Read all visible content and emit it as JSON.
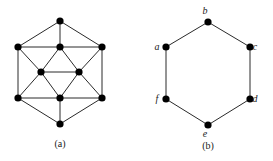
{
  "figures": [
    {
      "id": "a",
      "caption": "(a)",
      "caption_pos": [
        60,
        147
      ],
      "nodes": [
        {
          "x": 60,
          "y": 21
        },
        {
          "x": 18,
          "y": 47
        },
        {
          "x": 60,
          "y": 47
        },
        {
          "x": 102,
          "y": 47
        },
        {
          "x": 41,
          "y": 72
        },
        {
          "x": 79,
          "y": 72
        },
        {
          "x": 18,
          "y": 98
        },
        {
          "x": 60,
          "y": 98
        },
        {
          "x": 102,
          "y": 98
        },
        {
          "x": 60,
          "y": 124
        }
      ],
      "edges": [
        [
          0,
          1
        ],
        [
          0,
          2
        ],
        [
          0,
          3
        ],
        [
          1,
          2
        ],
        [
          2,
          3
        ],
        [
          1,
          6
        ],
        [
          3,
          8
        ],
        [
          1,
          4
        ],
        [
          2,
          4
        ],
        [
          2,
          5
        ],
        [
          3,
          5
        ],
        [
          4,
          5
        ],
        [
          4,
          6
        ],
        [
          4,
          7
        ],
        [
          5,
          7
        ],
        [
          5,
          8
        ],
        [
          6,
          7
        ],
        [
          7,
          8
        ],
        [
          6,
          9
        ],
        [
          7,
          9
        ],
        [
          8,
          9
        ]
      ]
    },
    {
      "id": "b",
      "caption": "(b)",
      "caption_pos": [
        208,
        149
      ],
      "nodes": [
        {
          "label": "a",
          "x": 166,
          "y": 47,
          "lx": 157,
          "ly": 50
        },
        {
          "label": "b",
          "x": 208,
          "y": 22,
          "lx": 205,
          "ly": 14
        },
        {
          "label": "c",
          "x": 250,
          "y": 47,
          "lx": 255,
          "ly": 50
        },
        {
          "label": "d",
          "x": 250,
          "y": 99,
          "lx": 255,
          "ly": 102
        },
        {
          "label": "e",
          "x": 208,
          "y": 125,
          "lx": 205,
          "ly": 137
        },
        {
          "label": "f",
          "x": 166,
          "y": 99,
          "lx": 157,
          "ly": 102
        }
      ],
      "edges": [
        [
          0,
          1
        ],
        [
          1,
          2
        ],
        [
          2,
          3
        ],
        [
          3,
          4
        ],
        [
          4,
          5
        ],
        [
          5,
          0
        ]
      ]
    }
  ],
  "style": {
    "node_color": "#000000",
    "edge_color": "#2a2a2a",
    "node_radius": 3.6
  }
}
